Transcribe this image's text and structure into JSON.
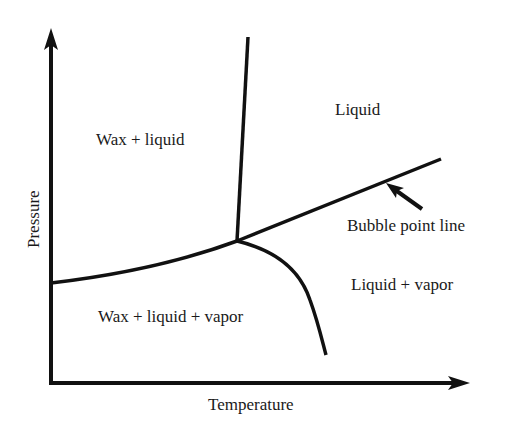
{
  "diagram": {
    "type": "phase-diagram",
    "axes": {
      "x_label": "Temperature",
      "y_label": "Pressure"
    },
    "regions": {
      "wax_liquid": "Wax + liquid",
      "liquid": "Liquid",
      "wax_liquid_vapor": "Wax + liquid + vapor",
      "liquid_vapor": "Liquid + vapor"
    },
    "annotations": {
      "bubble_point_line": "Bubble point line"
    },
    "colors": {
      "line": "#111111",
      "text": "#1a1a1a",
      "background": "#ffffff"
    }
  }
}
